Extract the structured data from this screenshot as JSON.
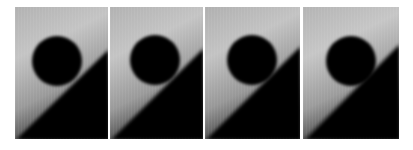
{
  "figure": {
    "background": "#ffffff",
    "panels": [
      {
        "index": 1,
        "x": 15,
        "width": 93,
        "circle_cx": 42,
        "circle_cy": 54,
        "circle_r": 25,
        "edge_right_y": 41,
        "edge_left_y": 132
      },
      {
        "index": 2,
        "x": 110,
        "width": 93,
        "circle_cx": 45,
        "circle_cy": 53,
        "circle_r": 25,
        "edge_right_y": 40,
        "edge_left_y": 132
      },
      {
        "index": 3,
        "x": 205,
        "width": 95,
        "circle_cx": 47,
        "circle_cy": 53,
        "circle_r": 25,
        "edge_right_y": 38,
        "edge_left_y": 130
      },
      {
        "index": 4,
        "x": 303,
        "width": 96,
        "circle_cx": 48,
        "circle_cy": 54,
        "circle_r": 25,
        "edge_right_y": 36,
        "edge_left_y": 130
      }
    ],
    "colors": {
      "light_top": "#b4b4b4",
      "light_mid": "#c6c6c6",
      "light_low": "#8a8a8a",
      "light_edge": "#4a4a4a",
      "dark": "#050505",
      "disk": "#030303"
    }
  }
}
